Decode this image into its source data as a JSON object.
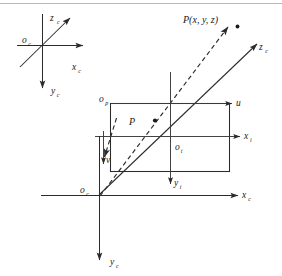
{
  "figure": {
    "background_color": "#ffffff",
    "line_color": "#2b2b2b",
    "rule_color": "#b9b9b9",
    "width": 282,
    "height": 276
  },
  "camera_frame_inset": {
    "name": "camera coordinate frame inset",
    "origin_label": "o",
    "origin_sub": "c",
    "x_label": "x",
    "x_sub": "c",
    "y_label": "y",
    "y_sub": "c",
    "z_label": "z",
    "z_sub": "c"
  },
  "world_frame": {
    "name": "main camera coordinate frame",
    "origin_label": "o",
    "origin_sub": "c",
    "x_label": "x",
    "x_sub": "c",
    "y_label": "y",
    "y_sub": "c",
    "z_label": "z",
    "z_sub": "c"
  },
  "image_plane": {
    "name": "image plane rectangle",
    "corner_label": "o",
    "corner_sub": "p",
    "u_label": "u",
    "v_label": "v",
    "center_label": "o",
    "center_sub": "i",
    "x_label": "x",
    "x_sub": "i",
    "y_label": "y",
    "y_sub": "i"
  },
  "points": {
    "world_point_label": "P(x, y, z)",
    "image_point_label": "P"
  }
}
